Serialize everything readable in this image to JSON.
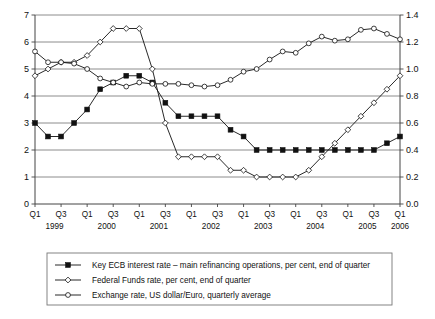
{
  "chart_data": {
    "type": "line",
    "title": "",
    "subtitle": "",
    "xlabel": "",
    "ylabel": "",
    "grid": true,
    "legend_position": "bottom",
    "x": [
      "Q1",
      "Q2",
      "Q3",
      "Q4",
      "Q1",
      "Q2",
      "Q3",
      "Q4",
      "Q1",
      "Q2",
      "Q3",
      "Q4",
      "Q1",
      "Q2",
      "Q3",
      "Q4",
      "Q1",
      "Q2",
      "Q3",
      "Q4",
      "Q1",
      "Q2",
      "Q3",
      "Q4",
      "Q1",
      "Q2",
      "Q3",
      "Q4",
      "Q1"
    ],
    "categories": [
      "1999 Q1",
      "1999 Q2",
      "1999 Q3",
      "1999 Q4",
      "2000 Q1",
      "2000 Q2",
      "2000 Q3",
      "2000 Q4",
      "2001 Q1",
      "2001 Q2",
      "2001 Q3",
      "2001 Q4",
      "2002 Q1",
      "2002 Q2",
      "2002 Q3",
      "2002 Q4",
      "2003 Q1",
      "2003 Q2",
      "2003 Q3",
      "2003 Q4",
      "2004 Q1",
      "2004 Q2",
      "2004 Q3",
      "2004 Q4",
      "2005 Q1",
      "2005 Q2",
      "2005 Q3",
      "2005 Q4",
      "2006 Q1"
    ],
    "x_tick_labels": [
      "Q1",
      "Q3",
      "Q1",
      "Q3",
      "Q1",
      "Q3",
      "Q1",
      "Q3",
      "Q1",
      "Q3",
      "Q1",
      "Q3",
      "Q1",
      "Q3",
      "Q1"
    ],
    "year_labels": [
      "1999",
      "2000",
      "2001",
      "2002",
      "2003",
      "2004",
      "2005",
      "2006"
    ],
    "ylim": [
      0,
      7
    ],
    "y_ticks": [
      0,
      1,
      2,
      3,
      4,
      5,
      6,
      7
    ],
    "y_tick_labels": [
      "0",
      "1",
      "2",
      "3",
      "4",
      "5",
      "6",
      "7"
    ],
    "y2lim": [
      0.0,
      1.4
    ],
    "y2_ticks": [
      0.0,
      0.2,
      0.4,
      0.6,
      0.8,
      1.0,
      1.2,
      1.4
    ],
    "y2_tick_labels": [
      "0.0",
      "0.2",
      "0.4",
      "0.6",
      "0.8",
      "1.0",
      "1.2",
      "1.4"
    ],
    "series": [
      {
        "name": "Key ECB interest rate – main refinancing operations, per cent, end of quarter",
        "axis": "left",
        "marker": "filled-square",
        "color": "#111111",
        "values": [
          3.0,
          2.5,
          2.5,
          3.0,
          3.5,
          4.25,
          4.5,
          4.75,
          4.75,
          4.5,
          3.75,
          3.25,
          3.25,
          3.25,
          3.25,
          2.75,
          2.5,
          2.0,
          2.0,
          2.0,
          2.0,
          2.0,
          2.0,
          2.0,
          2.0,
          2.0,
          2.0,
          2.25,
          2.5
        ]
      },
      {
        "name": "Federal Funds rate, per cent, end of quarter",
        "axis": "left",
        "marker": "open-diamond",
        "color": "#111111",
        "values": [
          4.75,
          5.0,
          5.25,
          5.25,
          5.5,
          6.0,
          6.5,
          6.5,
          6.5,
          5.0,
          3.0,
          1.75,
          1.75,
          1.75,
          1.75,
          1.25,
          1.25,
          1.0,
          1.0,
          1.0,
          1.0,
          1.25,
          1.75,
          2.25,
          2.75,
          3.25,
          3.75,
          4.25,
          4.75
        ]
      },
      {
        "name": "Exchange rate, US dollar/Euro, quarterly average",
        "axis": "right",
        "marker": "open-circle",
        "color": "#111111",
        "values": [
          1.13,
          1.05,
          1.05,
          1.04,
          1.0,
          0.93,
          0.9,
          0.87,
          0.9,
          0.89,
          0.89,
          0.89,
          0.88,
          0.87,
          0.88,
          0.92,
          0.98,
          1.0,
          1.07,
          1.13,
          1.12,
          1.19,
          1.24,
          1.21,
          1.22,
          1.29,
          1.3,
          1.26,
          1.22
        ]
      }
    ]
  },
  "legend": {
    "entries": [
      {
        "label": "Key ECB interest rate – main refinancing operations, per cent, end of quarter",
        "marker": "filled-square"
      },
      {
        "label": "Federal Funds rate, per cent, end of quarter",
        "marker": "open-diamond"
      },
      {
        "label": "Exchange rate, US dollar/Euro, quarterly average",
        "marker": "open-circle"
      }
    ]
  }
}
